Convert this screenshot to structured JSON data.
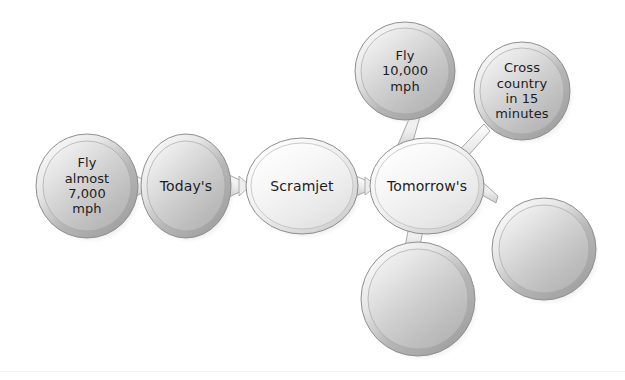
{
  "diagram": {
    "background_color": "#ffffff",
    "text_color": "#1d1d1d",
    "shape_colors": {
      "filled_light": "#f3f3f3",
      "filled_mid_light": "#e2e2e2",
      "filled_mid": "#c9c9c9",
      "filled_dark": "#a9a9a9",
      "rim_light": "#efefef",
      "rim_dark": "#9a9a9a",
      "outline": "#8c8c8c",
      "shadow": "#cfcfcf"
    },
    "nodes": [
      {
        "id": "fly-almost-7000-mph",
        "label": "Fly\nalmost\n7,000\nmph",
        "shape": "circle",
        "style": "shaded",
        "cx": 87,
        "cy": 186,
        "rx": 51,
        "ry": 52,
        "font_size": 13
      },
      {
        "id": "todays",
        "label": "Today's",
        "shape": "circle",
        "style": "shaded",
        "cx": 186,
        "cy": 186,
        "rx": 45,
        "ry": 52,
        "font_size": 14
      },
      {
        "id": "scramjet",
        "label": "Scramjet",
        "shape": "ellipse",
        "style": "pale",
        "cx": 302,
        "cy": 186,
        "rx": 56,
        "ry": 48,
        "font_size": 14
      },
      {
        "id": "tomorrows",
        "label": "Tomorrow's",
        "shape": "ellipse",
        "style": "pale",
        "cx": 427,
        "cy": 186,
        "rx": 57,
        "ry": 48,
        "font_size": 14
      },
      {
        "id": "fly-10000-mph",
        "label": "Fly\n10,000\nmph",
        "shape": "circle",
        "style": "shaded",
        "cx": 405,
        "cy": 71,
        "rx": 50,
        "ry": 49,
        "font_size": 13
      },
      {
        "id": "cross-country-15-minutes",
        "label": "Cross\ncountry\nin 15\nminutes",
        "shape": "circle",
        "style": "shaded",
        "cx": 522,
        "cy": 91,
        "rx": 48,
        "ry": 49,
        "font_size": 13
      },
      {
        "id": "blank-right",
        "label": "",
        "shape": "circle",
        "style": "shaded",
        "cx": 544,
        "cy": 249,
        "rx": 52,
        "ry": 51,
        "font_size": 13
      },
      {
        "id": "blank-bottom",
        "label": "",
        "shape": "circle",
        "style": "shaded",
        "cx": 418,
        "cy": 299,
        "rx": 57,
        "ry": 57,
        "font_size": 13
      }
    ],
    "connectors": [
      {
        "id": "fly7000-to-todays",
        "from": "fly-almost-7000-mph",
        "to": "todays"
      },
      {
        "id": "todays-to-scramjet",
        "from": "todays",
        "to": "scramjet"
      },
      {
        "id": "scramjet-to-tomorrows",
        "from": "scramjet",
        "to": "tomorrows"
      },
      {
        "id": "tomorrows-to-fly10000",
        "from": "tomorrows",
        "to": "fly-10000-mph"
      },
      {
        "id": "tomorrows-to-crosscountry",
        "from": "tomorrows",
        "to": "cross-country-15-minutes"
      },
      {
        "id": "tomorrows-to-blank-right",
        "from": "tomorrows",
        "to": "blank-right"
      },
      {
        "id": "tomorrows-to-blank-bottom",
        "from": "tomorrows",
        "to": "blank-bottom"
      }
    ]
  }
}
